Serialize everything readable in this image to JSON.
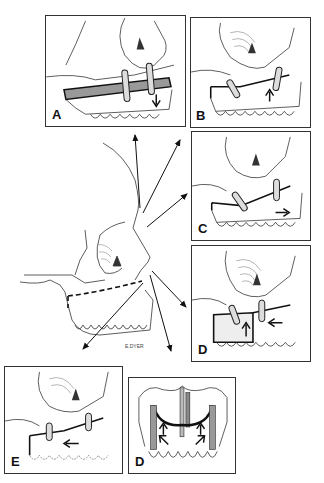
{
  "figure": {
    "panels": [
      {
        "id": "A",
        "label": "A",
        "movement": "down"
      },
      {
        "id": "B",
        "label": "B",
        "movement": "up"
      },
      {
        "id": "C",
        "label": "C",
        "movement": "forward"
      },
      {
        "id": "D1",
        "label": "D",
        "movement": "up-back"
      },
      {
        "id": "E",
        "label": "E",
        "movement": "back"
      },
      {
        "id": "D2",
        "label": "D",
        "movement": "frontal-view"
      }
    ],
    "signature": "E.DYER"
  },
  "colors": {
    "line": "#222222",
    "background": "#ffffff",
    "hatch": "#555555"
  }
}
